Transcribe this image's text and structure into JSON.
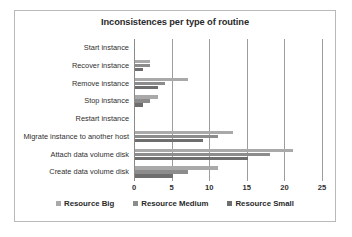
{
  "chart_data": {
    "type": "bar",
    "orientation": "horizontal",
    "title": "Inconsistences per type of routine",
    "xlabel": "",
    "ylabel": "",
    "xlim": [
      0,
      25
    ],
    "xticks": [
      0,
      5,
      10,
      15,
      20,
      25
    ],
    "grid": true,
    "legend_position": "bottom",
    "categories": [
      "Create data volume disk",
      "Attach data volume disk",
      "Migrate instance to another host",
      "Restart instance",
      "Stop instance",
      "Remove instance",
      "Recover instance",
      "Start instance"
    ],
    "series": [
      {
        "name": "Resource Big",
        "color": "#a9a9a9",
        "values": [
          11,
          21,
          13,
          0,
          3,
          7,
          2,
          0
        ]
      },
      {
        "name": "Resource Medium",
        "color": "#8c8c8c",
        "values": [
          7,
          18,
          11,
          0,
          2,
          4,
          2,
          0
        ]
      },
      {
        "name": "Resource Small",
        "color": "#6e6e6e",
        "values": [
          5,
          15,
          9,
          0,
          1,
          3,
          1,
          0
        ]
      }
    ]
  }
}
